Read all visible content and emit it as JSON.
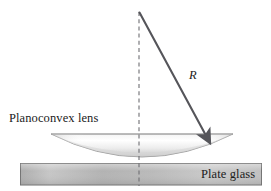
{
  "figure": {
    "background_color": "#ffffff",
    "width": 271,
    "height": 191,
    "labels": {
      "lens_label": "Planoconvex lens",
      "plate_label": "Plate glass",
      "radius_label": "R"
    },
    "colors": {
      "line_dark": "#55555a",
      "dashed_line": "#6e6e73",
      "lens_light": "#ffffff",
      "lens_mid": "#e2e2e2",
      "lens_shadow": "#b9b9b9",
      "lens_outline": "#9a9a9a",
      "plate_light": "#d8d8d8",
      "plate_mid": "#b4b4b4",
      "plate_dark": "#9c9c9c",
      "plate_outline": "#6f6f6f",
      "text": "#1b1b1b"
    },
    "geometry": {
      "center_of_curvature": {
        "x": 139,
        "y": 12
      },
      "arrow_tip": {
        "x": 211,
        "y": 144
      },
      "axis_line": {
        "x": 139,
        "y_top": 12,
        "y_bottom": 186
      },
      "lens": {
        "left_x": 51,
        "right_x": 233,
        "top_y": 134,
        "vertex_y": 164
      },
      "plate": {
        "left_x": 20,
        "right_x": 262,
        "top_y": 163,
        "bottom_y": 185
      }
    }
  }
}
